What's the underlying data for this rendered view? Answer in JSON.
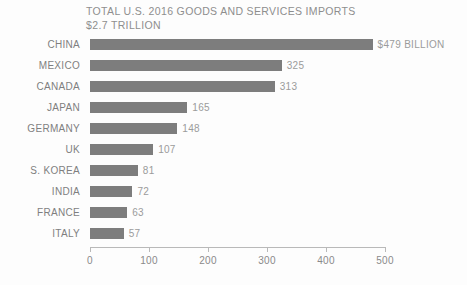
{
  "chart_data": {
    "type": "bar",
    "orientation": "horizontal",
    "title": "TOTAL U.S. 2016 GOODS AND SERVICES IMPORTS",
    "subtitle": "$2.7 TRILLION",
    "xlabel": "",
    "ylabel": "",
    "xlim": [
      0,
      500
    ],
    "xticks": [
      0,
      100,
      200,
      300,
      400,
      500
    ],
    "xtick_labels": [
      "0",
      "100",
      "200",
      "300",
      "400",
      "500"
    ],
    "grid": false,
    "legend": null,
    "bar_color": "#7d7d7d",
    "label_color": "#7f7f7f",
    "value_color": "#9b9b9b",
    "axis_color": "#b9b9b9",
    "background": "#fdfdfd",
    "categories": [
      "CHINA",
      "MEXICO",
      "CANADA",
      "JAPAN",
      "GERMANY",
      "UK",
      "S. KOREA",
      "INDIA",
      "FRANCE",
      "ITALY"
    ],
    "values": [
      479,
      325,
      313,
      165,
      148,
      107,
      81,
      72,
      63,
      57
    ],
    "value_labels": [
      "$479 BILLION",
      "325",
      "313",
      "165",
      "148",
      "107",
      "81",
      "72",
      "63",
      "57"
    ],
    "units": "billions of USD"
  }
}
